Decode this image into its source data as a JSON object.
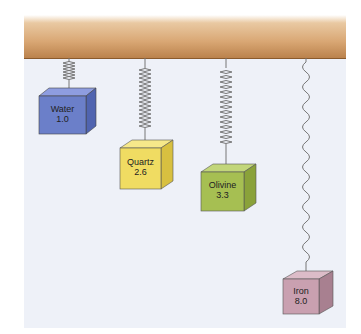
{
  "diagram": {
    "items": [
      {
        "name": "Water",
        "value": "1.0",
        "color": "#6b7fc9",
        "top_color": "#8e9de0",
        "side_color": "#5064b0"
      },
      {
        "name": "Quartz",
        "value": "2.6",
        "color": "#f0dc62",
        "top_color": "#f6e88a",
        "side_color": "#d8c040"
      },
      {
        "name": "Olivine",
        "value": "3.3",
        "color": "#a6bf52",
        "top_color": "#c2d67a",
        "side_color": "#8aa23a"
      },
      {
        "name": "Iron",
        "value": "8.0",
        "color": "#c9a0b0",
        "top_color": "#dcbcc8",
        "side_color": "#a88090"
      }
    ]
  }
}
